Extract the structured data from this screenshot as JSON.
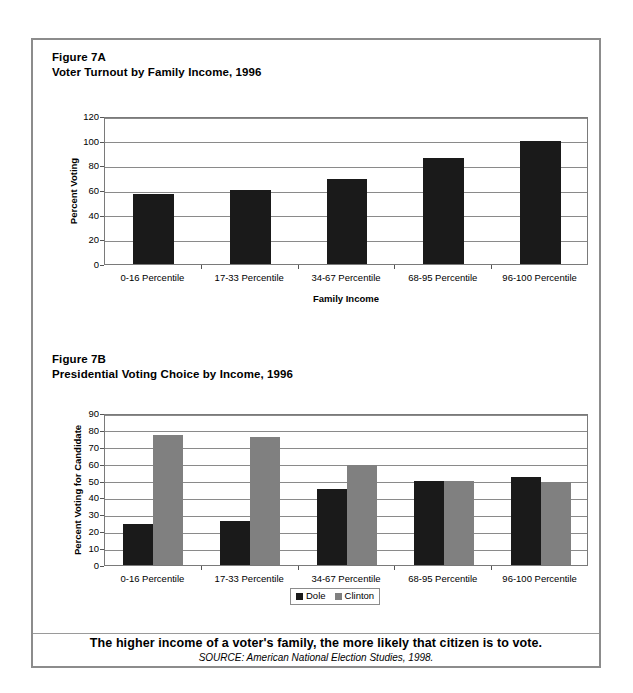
{
  "figure_a": {
    "label": "Figure 7A",
    "title": "Voter Turnout by Family Income, 1996"
  },
  "figure_b": {
    "label": "Figure 7B",
    "title": "Presidential Voting Choice by Income, 1996"
  },
  "caption": {
    "main": "The higher income of a voter's family, the more likely that citizen is to vote.",
    "source": "SOURCE: American National Election Studies, 1998."
  },
  "colors": {
    "dole": "#1a1a1a",
    "clinton": "#808080",
    "frame": "#8c8c8c",
    "grid": "#8a8a8a"
  },
  "chart_data": [
    {
      "type": "bar",
      "id": "figure-7a",
      "title": "Voter Turnout by Family Income, 1996",
      "categories": [
        "0-16 Percentile",
        "17-33 Percentile",
        "34-67 Percentile",
        "68-95 Percentile",
        "96-100 Percentile"
      ],
      "values": [
        57,
        60,
        69,
        86,
        100
      ],
      "series": [
        {
          "name": "Percent Voting",
          "values": [
            57,
            60,
            69,
            86,
            100
          ],
          "color": "#1a1a1a"
        }
      ],
      "xlabel": "Family Income",
      "ylabel": "Percent Voting",
      "ylim": [
        0,
        120
      ],
      "yticks": [
        0,
        20,
        40,
        60,
        80,
        100,
        120
      ],
      "grid": true,
      "legend": false
    },
    {
      "type": "bar",
      "id": "figure-7b",
      "title": "Presidential Voting Choice by Income, 1996",
      "categories": [
        "0-16 Percentile",
        "17-33 Percentile",
        "34-67 Percentile",
        "68-95 Percentile",
        "96-100 Percentile"
      ],
      "series": [
        {
          "name": "Dole",
          "values": [
            24,
            26,
            45,
            50,
            52
          ],
          "color": "#1a1a1a"
        },
        {
          "name": "Clinton",
          "values": [
            77,
            76,
            59,
            50,
            49
          ],
          "color": "#808080"
        }
      ],
      "xlabel": "",
      "ylabel": "Percent Voting for Candidate",
      "ylim": [
        0,
        90
      ],
      "yticks": [
        0,
        10,
        20,
        30,
        40,
        50,
        60,
        70,
        80,
        90
      ],
      "grid": true,
      "legend": true,
      "legend_position": "bottom"
    }
  ]
}
